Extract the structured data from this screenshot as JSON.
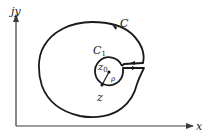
{
  "diagram": {
    "type": "contour-keyhole",
    "axes": {
      "x_label": "x",
      "y_label": "jy"
    },
    "contours": {
      "outer": {
        "label": "C"
      },
      "inner": {
        "label": "C",
        "label_subscript": "1"
      }
    },
    "points": {
      "center": {
        "label": "z",
        "label_subscript": "0"
      },
      "on_circle": {
        "label": "z"
      }
    },
    "radius": {
      "label": "ρ"
    },
    "colors": {
      "stroke": "#1a1a1a",
      "axis": "#3a3a3a",
      "background": "#ffffff"
    }
  }
}
